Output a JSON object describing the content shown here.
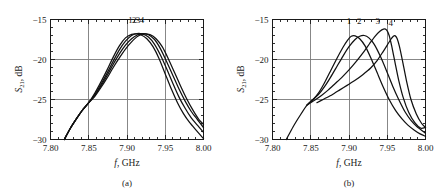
{
  "figure": {
    "panels": [
      {
        "id": "a",
        "caption": "(a)",
        "xlabel_italic": "f",
        "xlabel_rest": ", GHz",
        "ylabel_main": "S",
        "ylabel_sub": "21",
        "ylabel_rest": ", dB",
        "curve_labels": [
          "1",
          "2",
          "3",
          "4"
        ]
      },
      {
        "id": "b",
        "caption": "(b)",
        "xlabel_italic": "f",
        "xlabel_rest": ", GHz",
        "ylabel_main": "S",
        "ylabel_sub": "21",
        "ylabel_rest": ", dB",
        "curve_labels": [
          "1",
          "2",
          "3",
          "4"
        ]
      }
    ],
    "xticks": [
      "7.80",
      "7.85",
      "7.90",
      "7.95",
      "8.00"
    ],
    "yticks": [
      "-15",
      "-20",
      "-25",
      "-30"
    ]
  },
  "chart_data": [
    {
      "type": "line",
      "panel": "a",
      "title": "",
      "xlabel": "f, GHz",
      "ylabel": "S21, dB",
      "xlim": [
        7.8,
        8.0
      ],
      "ylim": [
        -30,
        -15
      ],
      "xticks": [
        7.8,
        7.85,
        7.9,
        7.95,
        8.0
      ],
      "yticks": [
        -15,
        -20,
        -25,
        -30
      ],
      "xminor_step": 0.01,
      "yminor_step": 1,
      "grid": true,
      "gridlines_x": [
        7.85,
        7.9,
        7.95
      ],
      "gridlines_y": [
        -20,
        -25
      ],
      "legend": "inline-numeric-labels",
      "legend_position": "above-peaks",
      "annotations": [
        {
          "text": "1",
          "x": 7.9045,
          "y": -15.4
        },
        {
          "text": "2",
          "x": 7.9095,
          "y": -15.4
        },
        {
          "text": "3",
          "x": 7.9145,
          "y": -15.4
        },
        {
          "text": "4",
          "x": 7.9195,
          "y": -15.4
        }
      ],
      "series": [
        {
          "name": "1",
          "x": [
            7.818,
            7.826,
            7.834,
            7.842,
            7.85,
            7.858,
            7.866,
            7.874,
            7.882,
            7.89,
            7.898,
            7.906,
            7.912,
            7.918,
            7.926,
            7.934,
            7.942,
            7.95,
            7.958,
            7.966,
            7.974,
            7.982,
            7.99,
            8.0
          ],
          "y": [
            -30.0,
            -28.6,
            -27.4,
            -26.3,
            -25.4,
            -24.2,
            -22.8,
            -21.3,
            -19.7,
            -18.3,
            -17.3,
            -16.85,
            -16.8,
            -16.9,
            -17.4,
            -18.4,
            -19.9,
            -21.8,
            -23.7,
            -25.4,
            -26.8,
            -27.9,
            -28.8,
            -29.9
          ]
        },
        {
          "name": "2",
          "x": [
            7.818,
            7.826,
            7.834,
            7.842,
            7.85,
            7.858,
            7.866,
            7.874,
            7.882,
            7.89,
            7.898,
            7.906,
            7.913,
            7.92,
            7.928,
            7.936,
            7.944,
            7.952,
            7.96,
            7.968,
            7.976,
            7.984,
            7.992,
            8.0
          ],
          "y": [
            -30.0,
            -28.6,
            -27.4,
            -26.3,
            -25.4,
            -24.4,
            -23.1,
            -21.7,
            -20.2,
            -18.8,
            -17.7,
            -17.0,
            -16.75,
            -16.8,
            -17.2,
            -18.1,
            -19.5,
            -21.2,
            -23.0,
            -24.7,
            -26.1,
            -27.3,
            -28.2,
            -29.1
          ]
        },
        {
          "name": "3",
          "x": [
            7.818,
            7.826,
            7.834,
            7.842,
            7.85,
            7.858,
            7.866,
            7.874,
            7.882,
            7.89,
            7.898,
            7.906,
            7.914,
            7.921,
            7.928,
            7.936,
            7.944,
            7.952,
            7.96,
            7.968,
            7.976,
            7.984,
            7.992,
            8.0
          ],
          "y": [
            -30.0,
            -28.6,
            -27.4,
            -26.3,
            -25.4,
            -24.5,
            -23.3,
            -22.0,
            -20.6,
            -19.3,
            -18.2,
            -17.4,
            -16.9,
            -16.75,
            -16.9,
            -17.5,
            -18.7,
            -20.3,
            -22.0,
            -23.7,
            -25.2,
            -26.5,
            -27.5,
            -28.5
          ]
        },
        {
          "name": "4",
          "x": [
            7.818,
            7.826,
            7.834,
            7.842,
            7.85,
            7.858,
            7.866,
            7.874,
            7.882,
            7.89,
            7.898,
            7.906,
            7.914,
            7.922,
            7.93,
            7.938,
            7.946,
            7.954,
            7.962,
            7.97,
            7.978,
            7.986,
            7.994,
            8.0
          ],
          "y": [
            -30.0,
            -28.6,
            -27.4,
            -26.3,
            -25.4,
            -24.6,
            -23.5,
            -22.3,
            -21.0,
            -19.8,
            -18.7,
            -17.8,
            -17.1,
            -16.8,
            -16.9,
            -17.4,
            -18.4,
            -19.9,
            -21.6,
            -23.3,
            -24.9,
            -26.3,
            -27.5,
            -28.1
          ]
        }
      ]
    },
    {
      "type": "line",
      "panel": "b",
      "title": "",
      "xlabel": "f, GHz",
      "ylabel": "S21, dB",
      "xlim": [
        7.8,
        8.0
      ],
      "ylim": [
        -30,
        -15
      ],
      "xticks": [
        7.8,
        7.85,
        7.9,
        7.95,
        8.0
      ],
      "yticks": [
        -15,
        -20,
        -25,
        -30
      ],
      "xminor_step": 0.01,
      "yminor_step": 1,
      "grid": true,
      "gridlines_x": [
        7.85,
        7.9,
        7.95
      ],
      "gridlines_y": [
        -20,
        -25
      ],
      "legend": "inline-numeric-labels",
      "legend_position": "above-peaks",
      "annotations": [
        {
          "text": "1",
          "x": 7.9,
          "y": -15.5
        },
        {
          "text": "2",
          "x": 7.9135,
          "y": -15.5
        },
        {
          "text": "3",
          "x": 7.9375,
          "y": -15.5
        },
        {
          "text": "4",
          "x": 7.9545,
          "y": -15.8
        }
      ],
      "series": [
        {
          "name": "1",
          "x": [
            7.818,
            7.827,
            7.836,
            7.845,
            7.853,
            7.86,
            7.868,
            7.876,
            7.884,
            7.892,
            7.898,
            7.903,
            7.908,
            7.914,
            7.921,
            7.929,
            7.937,
            7.945,
            7.953,
            7.961,
            7.969,
            7.977,
            7.985,
            7.993,
            8.0
          ],
          "y": [
            -30.0,
            -28.4,
            -27.0,
            -25.7,
            -25.0,
            -24.2,
            -22.9,
            -21.4,
            -19.9,
            -18.5,
            -17.6,
            -17.1,
            -17.05,
            -17.4,
            -18.3,
            -19.9,
            -21.7,
            -23.5,
            -25.1,
            -26.4,
            -27.4,
            -28.2,
            -28.8,
            -29.3,
            -29.6
          ]
        },
        {
          "name": "2",
          "x": [
            7.845,
            7.853,
            7.86,
            7.868,
            7.876,
            7.884,
            7.892,
            7.9,
            7.908,
            7.914,
            7.92,
            7.926,
            7.933,
            7.941,
            7.949,
            7.957,
            7.965,
            7.973,
            7.981,
            7.989,
            8.0
          ],
          "y": [
            -25.7,
            -25.0,
            -24.4,
            -23.4,
            -22.2,
            -20.9,
            -19.6,
            -18.4,
            -17.5,
            -17.1,
            -17.0,
            -17.3,
            -18.1,
            -19.6,
            -21.4,
            -23.3,
            -25.0,
            -26.5,
            -27.6,
            -28.4,
            -29.2
          ]
        },
        {
          "name": "3",
          "x": [
            7.845,
            7.855,
            7.864,
            7.873,
            7.882,
            7.891,
            7.9,
            7.909,
            7.918,
            7.927,
            7.934,
            7.94,
            7.945,
            7.949,
            7.9525,
            7.956,
            7.96,
            7.965,
            7.971,
            7.978,
            7.986,
            7.994,
            8.0
          ],
          "y": [
            -25.7,
            -25.1,
            -24.5,
            -23.8,
            -23.0,
            -22.2,
            -21.3,
            -20.3,
            -19.2,
            -18.0,
            -17.1,
            -16.5,
            -16.2,
            -16.3,
            -17.0,
            -18.4,
            -20.3,
            -22.6,
            -24.8,
            -26.6,
            -27.9,
            -28.6,
            -28.5
          ]
        },
        {
          "name": "4",
          "x": [
            7.858,
            7.868,
            7.878,
            7.888,
            7.898,
            7.908,
            7.918,
            7.928,
            7.937,
            7.944,
            7.95,
            7.9545,
            7.958,
            7.9605,
            7.963,
            7.966,
            7.97,
            7.975,
            7.981,
            7.988,
            7.995,
            8.0
          ],
          "y": [
            -25.4,
            -24.9,
            -24.4,
            -23.8,
            -23.2,
            -22.6,
            -21.9,
            -21.1,
            -20.1,
            -19.1,
            -18.2,
            -17.5,
            -17.1,
            -17.05,
            -17.4,
            -18.4,
            -20.2,
            -22.6,
            -25.0,
            -26.8,
            -28.0,
            -28.5
          ]
        }
      ]
    }
  ]
}
